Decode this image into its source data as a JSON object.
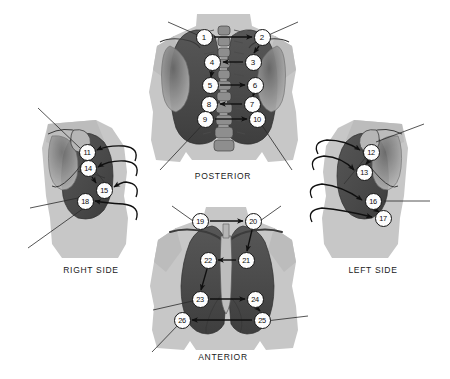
{
  "figure": {
    "background_color": "#ffffff",
    "body_silhouette_color": "#c7c7c7",
    "body_silhouette_shade_color": "#b4b4b4",
    "lung_field_color": "#4d4d4d",
    "lung_field_dark_color": "#3a3a3a",
    "bone_color": "#9a9a9a",
    "marker_fill_color": "#fdfdfd",
    "marker_border_color": "#141414",
    "arrow_color": "#101010",
    "leader_line_color": "#2a2a2a"
  },
  "views": [
    {
      "id": "posterior",
      "caption": "POSTERIOR",
      "markers": [
        {
          "label": "1",
          "x": 204,
          "y": 37
        },
        {
          "label": "2",
          "x": 262,
          "y": 37
        },
        {
          "label": "3",
          "x": 253,
          "y": 62
        },
        {
          "label": "4",
          "x": 212,
          "y": 62
        },
        {
          "label": "5",
          "x": 210,
          "y": 85
        },
        {
          "label": "6",
          "x": 255,
          "y": 85
        },
        {
          "label": "7",
          "x": 252,
          "y": 104
        },
        {
          "label": "8",
          "x": 209,
          "y": 104
        },
        {
          "label": "9",
          "x": 205,
          "y": 119
        },
        {
          "label": "10",
          "x": 257,
          "y": 119
        }
      ]
    },
    {
      "id": "anterior",
      "caption": "ANTERIOR",
      "markers": [
        {
          "label": "19",
          "x": 200,
          "y": 221
        },
        {
          "label": "20",
          "x": 253,
          "y": 221
        },
        {
          "label": "21",
          "x": 246,
          "y": 260
        },
        {
          "label": "22",
          "x": 208,
          "y": 260
        },
        {
          "label": "23",
          "x": 200,
          "y": 299
        },
        {
          "label": "24",
          "x": 255,
          "y": 299
        },
        {
          "label": "25",
          "x": 262,
          "y": 320
        },
        {
          "label": "26",
          "x": 182,
          "y": 320
        }
      ]
    },
    {
      "id": "right-side",
      "caption": "RIGHT SIDE",
      "markers": [
        {
          "label": "11",
          "x": 87,
          "y": 152
        },
        {
          "label": "14",
          "x": 88,
          "y": 168
        },
        {
          "label": "15",
          "x": 104,
          "y": 190
        },
        {
          "label": "18",
          "x": 85,
          "y": 201
        }
      ]
    },
    {
      "id": "left-side",
      "caption": "LEFT SIDE",
      "markers": [
        {
          "label": "12",
          "x": 371,
          "y": 152
        },
        {
          "label": "13",
          "x": 364,
          "y": 172
        },
        {
          "label": "16",
          "x": 373,
          "y": 201
        },
        {
          "label": "17",
          "x": 383,
          "y": 218
        }
      ]
    }
  ],
  "sequence": {
    "posterior_order": [
      "1",
      "2",
      "3",
      "4",
      "5",
      "6",
      "7",
      "8",
      "9",
      "10"
    ],
    "side_order": [
      "11",
      "12",
      "13",
      "14",
      "15",
      "16",
      "17",
      "18"
    ],
    "anterior_order": [
      "19",
      "20",
      "21",
      "22",
      "23",
      "24",
      "25",
      "26"
    ],
    "total_sites": 26
  }
}
